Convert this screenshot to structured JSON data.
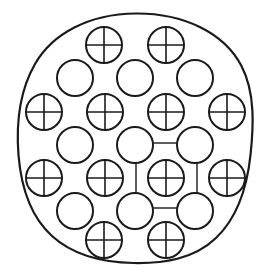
{
  "figure": {
    "type": "crystal-lattice-schematic",
    "canvas": {
      "width": 270,
      "height": 279,
      "background": "#ffffff"
    }
  },
  "style": {
    "stroke_color": "#1a1a1a",
    "fill_color": "#ffffff",
    "boundary_stroke_width": 2.2,
    "atom_stroke_width": 2.0,
    "cross_stroke_width": 1.6,
    "unit_cell_stroke_width": 1.4,
    "atom_radius": 18
  },
  "grain_boundary": {
    "name": "grain-outline",
    "shape": "irregular-rounded-blob",
    "bounds": {
      "left": 18,
      "top": 13,
      "right": 253,
      "bottom": 263
    },
    "path": "M 135.5 13.5 C 183 13.0 224 32.5 241.5 66.0 C 255.5 93.0 253.5 127.0 250.5 155.0 C 247.0 188.0 238.0 217.0 216.0 238.0 C 193.5 259.5 163.0 263.5 134.0 263.0 C 104.5 262.5 74.0 256.0 52.0 236.0 C 30.0 216.0 21.0 186.0 18.5 155.0 C 16.0 123.0 19.5 91.0 35.0 64.0 C 52.5 33.5 89.0 14.0 135.5 13.5 Z"
  },
  "unit_cell": {
    "name": "unit-cell-square",
    "shape": "square",
    "x": 136,
    "y": 143,
    "width": 61,
    "height": 65,
    "description": "square outlined by four corner atoms with one centered atom"
  },
  "atom_types": [
    {
      "key": "crossed",
      "label": "crossed-atom",
      "marker": "circle-with-cross",
      "count": 12
    },
    {
      "key": "plain",
      "label": "plain-atom",
      "marker": "open-circle",
      "count": 9
    }
  ],
  "rows": [
    {
      "index": 1,
      "type": "crossed",
      "y": 45,
      "x": [
        104,
        166
      ]
    },
    {
      "index": 2,
      "type": "plain",
      "y": 78,
      "x": [
        75,
        135,
        195
      ]
    },
    {
      "index": 3,
      "type": "crossed",
      "y": 112,
      "x": [
        44,
        105,
        166,
        227
      ]
    },
    {
      "index": 4,
      "type": "plain",
      "y": 145,
      "x": [
        75,
        135,
        195
      ]
    },
    {
      "index": 5,
      "type": "crossed",
      "y": 178,
      "x": [
        44,
        105,
        166,
        227
      ]
    },
    {
      "index": 6,
      "type": "plain",
      "y": 211,
      "x": [
        75,
        135,
        195
      ]
    },
    {
      "index": 7,
      "type": "crossed",
      "y": 240,
      "x": [
        104,
        166
      ]
    }
  ]
}
